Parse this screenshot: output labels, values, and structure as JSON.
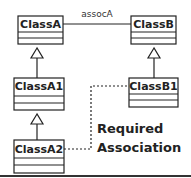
{
  "diagram": {
    "type": "uml-class-diagram",
    "classes": [
      {
        "id": "ClassA",
        "name": "ClassA"
      },
      {
        "id": "ClassB",
        "name": "ClassB"
      },
      {
        "id": "ClassA1",
        "name": "ClassA1"
      },
      {
        "id": "ClassB1",
        "name": "ClassB1"
      },
      {
        "id": "ClassA2",
        "name": "ClassA2"
      }
    ],
    "edges": [
      {
        "from": "ClassA",
        "to": "ClassB",
        "kind": "association",
        "label": "assocA"
      },
      {
        "from": "ClassA1",
        "to": "ClassA",
        "kind": "generalization"
      },
      {
        "from": "ClassB1",
        "to": "ClassB",
        "kind": "generalization"
      },
      {
        "from": "ClassA2",
        "to": "ClassA1",
        "kind": "generalization"
      },
      {
        "from": "ClassA2",
        "to": "ClassB1",
        "kind": "dependency-dotted"
      }
    ],
    "note": {
      "line1": "Required",
      "line2": "Association"
    },
    "colors": {
      "stroke": "#222222",
      "background": "#ffffff"
    }
  }
}
